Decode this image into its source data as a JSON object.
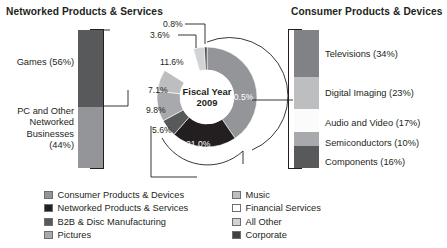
{
  "headings": {
    "left": "Networked Products & Services",
    "right": "Consumer Products & Devices"
  },
  "center": {
    "line1": "Fiscal Year",
    "line2": "2009"
  },
  "chart_data": {
    "type": "pie",
    "title": "Fiscal Year 2009",
    "subtitle": "Sales Breakdown by Segment",
    "legend_position": "bottom",
    "grid": false,
    "donut": true,
    "labels": [
      "Consumer Products & Devices",
      "Networked Products & Services",
      "B2B & Disc Manufacturing",
      "Pictures",
      "Music",
      "Financial Services",
      "All Other",
      "Corporate"
    ],
    "values": [
      40.5,
      21.0,
      5.6,
      9.8,
      7.1,
      11.6,
      3.6,
      0.8
    ],
    "value_labels": [
      "40.5%",
      "21.0%",
      "5.6%",
      "9.8%",
      "7.1%",
      "11.6%",
      "3.6%",
      "0.8%"
    ],
    "colors": [
      "#939598",
      "#231f20",
      "#58595b",
      "#a7a9ac",
      "#bcbec0",
      "#ffffff",
      "#d1d3d4",
      "#414042"
    ],
    "breakout_charts": [
      {
        "type": "bar",
        "orientation": "vertical-stacked",
        "title": "Networked Products & Services",
        "categories": [
          "Games",
          "PC and Other Networked Businesses"
        ],
        "values": [
          56,
          44
        ],
        "value_labels": [
          "Games (56%)",
          "PC and Other\nNetworked\nBusinesses\n(44%)"
        ],
        "colors": [
          "#58595b",
          "#939598"
        ]
      },
      {
        "type": "bar",
        "orientation": "vertical-stacked",
        "title": "Consumer Products & Devices",
        "categories": [
          "Televisions",
          "Digital Imaging",
          "Audio and Video",
          "Semiconductors",
          "Components"
        ],
        "values": [
          34,
          23,
          17,
          10,
          16
        ],
        "value_labels": [
          "Televisions (34%)",
          "Digital Imaging (23%)",
          "Audio and Video (17%)",
          "Semiconductors (10%)",
          "Components (16%)"
        ],
        "colors": [
          "#808285",
          "#bcbec0",
          "#fbfbfb",
          "#a7a9ac",
          "#58595b"
        ]
      }
    ]
  },
  "left_bar": {
    "segments": [
      {
        "label": "Games (56%)",
        "pct": 56,
        "color": "#58595b"
      },
      {
        "label": "PC and Other\nNetworked\nBusinesses\n(44%)",
        "pct": 44,
        "color": "#939598"
      }
    ]
  },
  "right_bar": {
    "segments": [
      {
        "label": "Televisions (34%)",
        "pct": 34,
        "color": "#808285"
      },
      {
        "label": "Digital Imaging (23%)",
        "pct": 23,
        "color": "#bcbec0"
      },
      {
        "label": "Audio and Video (17%)",
        "pct": 17,
        "color": "#fbfbfb"
      },
      {
        "label": "Semiconductors (10%)",
        "pct": 10,
        "color": "#a7a9ac"
      },
      {
        "label": "Components (16%)",
        "pct": 16,
        "color": "#58595b"
      }
    ]
  },
  "slice_labels": {
    "s1": "40.5%",
    "s2": "21.0%",
    "s3": "5.6%",
    "s4": "9.8%",
    "s5": "7.1%",
    "s6": "11.6%",
    "s7": "3.6%",
    "s8": "0.8%"
  },
  "legend": {
    "left_column": [
      {
        "label": "Consumer Products & Devices",
        "color": "#939598"
      },
      {
        "label": "Networked Products & Services",
        "color": "#231f20"
      },
      {
        "label": "B2B & Disc Manufacturing",
        "color": "#58595b"
      },
      {
        "label": "Pictures",
        "color": "#a7a9ac"
      }
    ],
    "right_column": [
      {
        "label": "Music",
        "color": "#bcbec0"
      },
      {
        "label": "Financial Services",
        "color": "#ffffff"
      },
      {
        "label": "All Other",
        "color": "#d1d3d4"
      },
      {
        "label": "Corporate",
        "color": "#414042"
      }
    ]
  }
}
